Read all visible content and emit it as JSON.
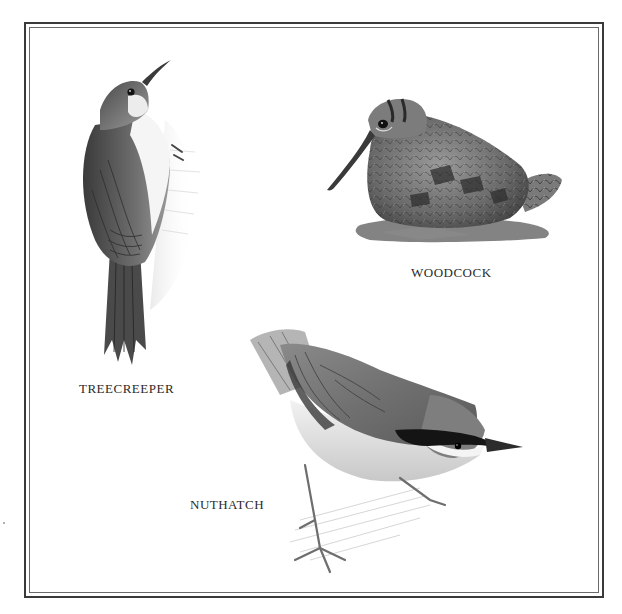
{
  "plate": {
    "frame": {
      "style": "double-line border",
      "outer_color": "#3a3a3a",
      "inner_color": "#6a6a6a"
    },
    "birds": [
      {
        "name": "treecreeper",
        "label": "TREECREEPER",
        "pose": "clinging upright to bark, head raised, curved bill"
      },
      {
        "name": "woodcock",
        "label": "WOODCOCK",
        "pose": "crouching on leaf litter, long straight bill"
      },
      {
        "name": "nuthatch",
        "label": "NUTHATCH",
        "pose": "perched head-down on branch, black eye stripe"
      }
    ],
    "palette": {
      "ink_dark": "#1e1e1e",
      "ink_mid": "#6b6b6b",
      "ink_light": "#b5b5b5",
      "paper": "#ffffff"
    }
  }
}
